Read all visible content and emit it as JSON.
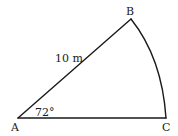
{
  "diagram": {
    "type": "circular-sector",
    "stroke_color": "#1a1a1a",
    "background": "#ffffff",
    "vertices": {
      "A": {
        "label": "A"
      },
      "B": {
        "label": "B"
      },
      "C": {
        "label": "C"
      }
    },
    "radius_label": "10 m",
    "angle_label": "72°",
    "edges": [
      {
        "from": "A",
        "to": "B",
        "kind": "straight",
        "label": "10 m"
      },
      {
        "from": "A",
        "to": "C",
        "kind": "straight"
      },
      {
        "from": "B",
        "to": "C",
        "kind": "arc"
      }
    ]
  }
}
